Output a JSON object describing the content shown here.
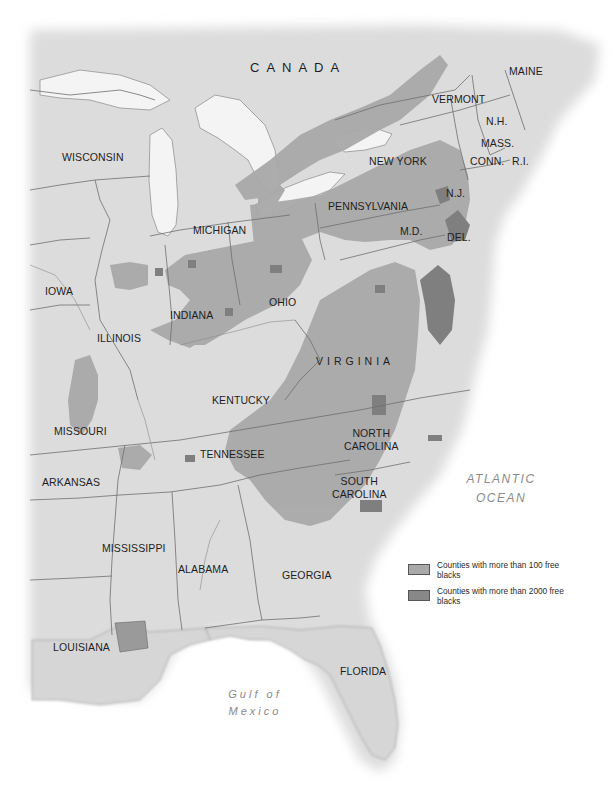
{
  "map": {
    "title": "",
    "colors": {
      "water": "#ffffff",
      "land": "#d9d9d9",
      "land_light": "#e6e6e6",
      "over_100": "#a9a9a9",
      "over_2000": "#888888",
      "border": "#6e6e6e"
    }
  },
  "labels": {
    "country": "CANADA",
    "states": {
      "maine": "MAINE",
      "vermont": "VERMONT",
      "nh": "N.H.",
      "mass": "MASS.",
      "conn": "CONN.",
      "ri": "R.I.",
      "new_york": "NEW YORK",
      "nj": "N.J.",
      "pennsylvania": "PENNSYLVANIA",
      "md": "M.D.",
      "del": "DEL.",
      "wisconsin": "WISCONSIN",
      "michigan": "MICHIGAN",
      "iowa": "IOWA",
      "indiana": "INDIANA",
      "ohio": "OHIO",
      "illinois": "ILLINOIS",
      "virginia": "VIRGINIA",
      "kentucky": "KENTUCKY",
      "missouri": "MISSOURI",
      "north_carolina": "NORTH\nCAROLINA",
      "tennessee": "TENNESSEE",
      "arkansas": "ARKANSAS",
      "south_carolina": "SOUTH\nCAROLINA",
      "mississippi": "MISSISSIPPI",
      "alabama": "ALABAMA",
      "georgia": "GEORGIA",
      "louisiana": "LOUISIANA",
      "florida": "FLORIDA"
    },
    "water": {
      "atlantic": "ATLANTIC\nOCEAN",
      "gulf": "Gulf of\nMexico"
    }
  },
  "legend": {
    "items": [
      {
        "label": "Counties with more than 100 free blacks",
        "color": "#a9a9a9"
      },
      {
        "label": "Counties with more than 2000 free blacks",
        "color": "#888888"
      }
    ]
  }
}
